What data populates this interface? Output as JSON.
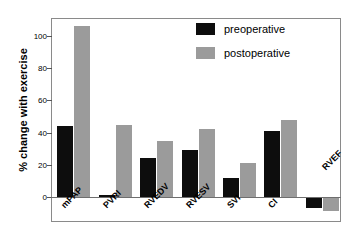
{
  "chart_data": {
    "type": "bar",
    "title": "",
    "subtitle": "",
    "xlabel": "",
    "ylabel": "% change with exercise",
    "categories": [
      "mPAP",
      "PVRI",
      "RVEDV",
      "RVESV",
      "SVI",
      "CI",
      "RVEF"
    ],
    "series": [
      {
        "name": "preoperative",
        "color": "#0d0d0d",
        "values": [
          44,
          1,
          24,
          29,
          12,
          41,
          -7
        ]
      },
      {
        "name": "postoperative",
        "color": "#9b9b9b",
        "values": [
          106,
          45,
          35,
          42,
          21,
          48,
          -9
        ]
      }
    ],
    "yticks": [
      0,
      20,
      40,
      60,
      80,
      100
    ],
    "ytick_labels": [
      "0",
      "20",
      "40",
      "60",
      "80",
      "100"
    ],
    "ylim": [
      -14,
      112
    ],
    "grid": false,
    "legend_position": "top-right",
    "legend_entries": [
      "preoperative",
      "postoperative"
    ],
    "annotations": []
  },
  "legend": {
    "preoperative_label": "preoperative",
    "postoperative_label": "postoperative"
  },
  "axis": {
    "y_title": "% change with exercise"
  }
}
